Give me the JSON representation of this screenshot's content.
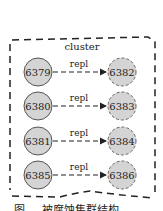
{
  "diagram": {
    "cluster_label": "cluster",
    "edge_label": "repl",
    "colors": {
      "node_fill": "#d4d4d4",
      "node_stroke": "#555555",
      "line": "#222222",
      "background": "#ffffff"
    },
    "pairs": [
      {
        "master": "6379",
        "replica": "6382"
      },
      {
        "master": "6380",
        "replica": "6383"
      },
      {
        "master": "6381",
        "replica": "6384"
      },
      {
        "master": "6385",
        "replica": "6386"
      }
    ],
    "caption": "图 ... 被腐蚀集群结构"
  }
}
